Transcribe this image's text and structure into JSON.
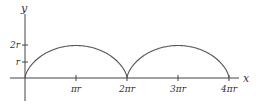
{
  "diagram": {
    "type": "cycloid-plot",
    "colors": {
      "axis": "#444444",
      "curve": "#555555",
      "text": "#333333"
    },
    "axes": {
      "x_label": "x",
      "y_label": "y"
    },
    "x_ticks": [
      {
        "label": "πr",
        "value": 1
      },
      {
        "label": "2πr",
        "value": 2
      },
      {
        "label": "3πr",
        "value": 3
      },
      {
        "label": "4πr",
        "value": 4
      }
    ],
    "y_ticks": [
      {
        "label": "r",
        "value": 1
      },
      {
        "label": "2r",
        "value": 2
      }
    ],
    "curve": {
      "name": "cycloid",
      "arches": 2,
      "equation": "x = r(t - sin t), y = r(1 - cos t)"
    }
  }
}
